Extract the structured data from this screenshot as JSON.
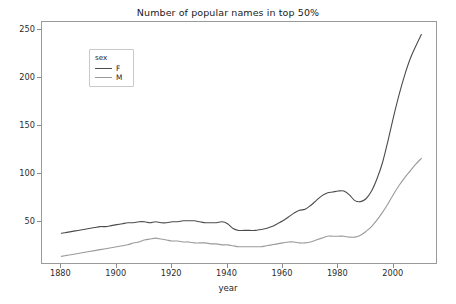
{
  "chart_data": {
    "type": "line",
    "title": "Number of popular names in top 50%",
    "xlabel": "year",
    "ylabel": "",
    "xlim": [
      1873,
      2016
    ],
    "ylim": [
      5,
      258
    ],
    "grid": false,
    "legend_position": "upper left",
    "legend_title": "sex",
    "xticks": [
      1880,
      1900,
      1920,
      1940,
      1960,
      1980,
      2000
    ],
    "yticks": [
      50,
      100,
      150,
      200,
      250
    ],
    "colors": {
      "F": "#4c4c4c",
      "M": "#9a9a9a",
      "axis": "#9a9a9a",
      "text": "#262626",
      "background": "#ffffff"
    },
    "x": [
      1880,
      1882,
      1884,
      1886,
      1888,
      1890,
      1892,
      1894,
      1896,
      1898,
      1900,
      1902,
      1904,
      1906,
      1908,
      1910,
      1912,
      1914,
      1916,
      1918,
      1920,
      1922,
      1924,
      1926,
      1928,
      1930,
      1932,
      1934,
      1936,
      1938,
      1940,
      1942,
      1944,
      1946,
      1948,
      1950,
      1952,
      1954,
      1956,
      1958,
      1960,
      1962,
      1964,
      1966,
      1968,
      1970,
      1972,
      1974,
      1976,
      1978,
      1980,
      1982,
      1984,
      1986,
      1988,
      1990,
      1992,
      1994,
      1996,
      1998,
      2000,
      2002,
      2004,
      2006,
      2008,
      2010
    ],
    "series": [
      {
        "name": "F",
        "values": [
          38,
          39,
          40,
          41,
          42,
          43,
          44,
          45,
          45,
          46,
          47,
          48,
          49,
          49,
          50,
          50,
          49,
          50,
          49,
          49,
          50,
          50,
          51,
          51,
          51,
          50,
          49,
          49,
          49,
          50,
          48,
          43,
          41,
          41,
          41,
          41,
          42,
          43,
          45,
          48,
          51,
          55,
          59,
          62,
          63,
          67,
          72,
          77,
          80,
          81,
          82,
          82,
          78,
          72,
          71,
          74,
          82,
          95,
          112,
          135,
          160,
          183,
          203,
          220,
          233,
          245
        ]
      },
      {
        "name": "M",
        "values": [
          14,
          15,
          16,
          17,
          18,
          19,
          20,
          21,
          22,
          23,
          24,
          25,
          26,
          28,
          29,
          31,
          32,
          33,
          32,
          31,
          30,
          30,
          29,
          29,
          28,
          28,
          28,
          27,
          27,
          26,
          26,
          25,
          24,
          24,
          24,
          24,
          24,
          25,
          26,
          27,
          28,
          29,
          29,
          28,
          28,
          29,
          31,
          33,
          35,
          35,
          35,
          35,
          34,
          34,
          36,
          40,
          45,
          52,
          60,
          69,
          79,
          88,
          96,
          103,
          110,
          116
        ]
      }
    ]
  }
}
